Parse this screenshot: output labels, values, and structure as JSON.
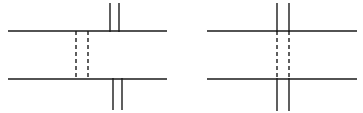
{
  "figure": {
    "type": "diagram",
    "canvas": {
      "width": 363,
      "height": 113,
      "background": "#ffffff"
    },
    "style": {
      "stroke_color": "#1a1a1a",
      "solid_width": 1.4,
      "dashed_width": 1.4,
      "dash_pattern": "4 3"
    },
    "panels": [
      {
        "id": "left-panel",
        "label": "left-diagram",
        "horizontal_lines": [
          {
            "name": "top-horizontal-line",
            "x1": 8,
            "y1": 31,
            "x2": 167,
            "y2": 31,
            "style": "solid"
          },
          {
            "name": "bottom-horizontal-line",
            "x1": 8,
            "y1": 79,
            "x2": 167,
            "y2": 79,
            "style": "solid"
          }
        ],
        "vertical_lines": [
          {
            "name": "upper-solid-vertical-left",
            "x1": 110,
            "y1": 3,
            "x2": 110,
            "y2": 32,
            "style": "solid"
          },
          {
            "name": "upper-solid-vertical-right",
            "x1": 119,
            "y1": 3,
            "x2": 119,
            "y2": 32,
            "style": "solid"
          },
          {
            "name": "lower-solid-vertical-left",
            "x1": 113,
            "y1": 78,
            "x2": 113,
            "y2": 110,
            "style": "solid"
          },
          {
            "name": "lower-solid-vertical-right",
            "x1": 122,
            "y1": 78,
            "x2": 122,
            "y2": 110,
            "style": "solid"
          },
          {
            "name": "hidden-dashed-vertical-left",
            "x1": 76,
            "y1": 31,
            "x2": 76,
            "y2": 79,
            "style": "dashed"
          },
          {
            "name": "hidden-dashed-vertical-right",
            "x1": 88,
            "y1": 31,
            "x2": 88,
            "y2": 79,
            "style": "dashed"
          }
        ]
      },
      {
        "id": "right-panel",
        "label": "right-diagram",
        "horizontal_lines": [
          {
            "name": "top-horizontal-line",
            "x1": 207,
            "y1": 31,
            "x2": 357,
            "y2": 31,
            "style": "solid"
          },
          {
            "name": "bottom-horizontal-line",
            "x1": 207,
            "y1": 79,
            "x2": 357,
            "y2": 79,
            "style": "solid"
          }
        ],
        "vertical_lines": [
          {
            "name": "upper-solid-vertical-left",
            "x1": 277,
            "y1": 3,
            "x2": 277,
            "y2": 32,
            "style": "solid"
          },
          {
            "name": "upper-solid-vertical-right",
            "x1": 289,
            "y1": 3,
            "x2": 289,
            "y2": 32,
            "style": "solid"
          },
          {
            "name": "lower-solid-vertical-left",
            "x1": 277,
            "y1": 78,
            "x2": 277,
            "y2": 111,
            "style": "solid"
          },
          {
            "name": "lower-solid-vertical-right",
            "x1": 289,
            "y1": 78,
            "x2": 289,
            "y2": 111,
            "style": "solid"
          },
          {
            "name": "hidden-dashed-vertical-left",
            "x1": 277,
            "y1": 31,
            "x2": 277,
            "y2": 79,
            "style": "dashed"
          },
          {
            "name": "hidden-dashed-vertical-right",
            "x1": 289,
            "y1": 31,
            "x2": 289,
            "y2": 79,
            "style": "dashed"
          }
        ]
      }
    ]
  }
}
